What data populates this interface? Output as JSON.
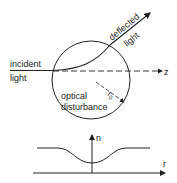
{
  "diagram": {
    "labels": {
      "incident_line1": "incident",
      "incident_line2": "light",
      "deflected_line1": "deflected",
      "deflected_line2": "light",
      "z_axis": "z",
      "disturbance_line1": "optical",
      "disturbance_line2": "disturbance",
      "radius": "r",
      "radius_sub": "0"
    },
    "plot": {
      "y_axis_label": "n",
      "x_axis_label": "r"
    },
    "colors": {
      "stroke": "#222222",
      "background": "#ffffff"
    }
  }
}
